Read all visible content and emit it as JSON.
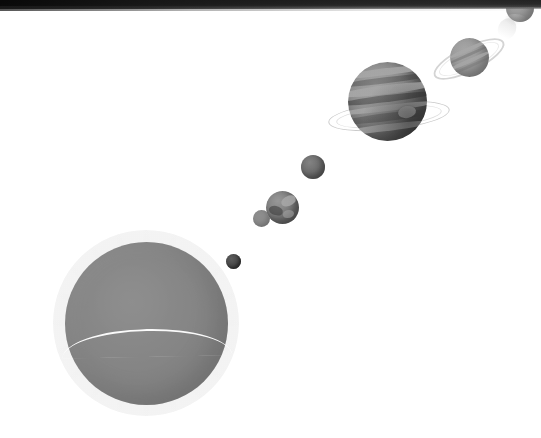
{
  "image": {
    "title": "Solar System diagram",
    "description": "Grayscale halftone print scan showing the Sun at lower left with the planets receding in a diagonal line toward the upper right",
    "background_color": "#ffffff",
    "width": 541,
    "height": 438,
    "style": "halftone grayscale scan",
    "scan_edge": {
      "name": "dark page edge band",
      "color": "#1a1a1a",
      "position": "top"
    }
  },
  "bodies": [
    {
      "id": "sun",
      "label": "Sun",
      "type": "star",
      "color": "#efefef",
      "has_corona": true,
      "has_seam_line": true,
      "diameter_px": 163,
      "center": {
        "x": 146,
        "y": 323
      }
    },
    {
      "id": "mercury",
      "label": "Mercury",
      "type": "planet",
      "order": 1,
      "color": "#6b6b6b",
      "diameter_px": 15,
      "center": {
        "x": 233,
        "y": 261
      }
    },
    {
      "id": "venus",
      "label": "Venus",
      "type": "planet",
      "order": 2,
      "color": "#f2f2f2",
      "diameter_px": 17,
      "center": {
        "x": 261,
        "y": 218
      }
    },
    {
      "id": "earth",
      "label": "Earth",
      "type": "planet",
      "order": 3,
      "color": "#b4b4b4",
      "diameter_px": 33,
      "center": {
        "x": 282,
        "y": 207
      }
    },
    {
      "id": "mars",
      "label": "Mars",
      "type": "planet",
      "order": 4,
      "color": "#9c9c9c",
      "diameter_px": 24,
      "center": {
        "x": 313,
        "y": 167
      }
    },
    {
      "id": "jupiter",
      "label": "Jupiter",
      "type": "planet",
      "order": 5,
      "color": "#c2c2c2",
      "diameter_px": 79,
      "center": {
        "x": 387,
        "y": 101
      },
      "has_rings": true,
      "has_great_red_spot": true,
      "cloud_bands": 7
    },
    {
      "id": "saturn",
      "label": "Saturn",
      "type": "planet",
      "order": 6,
      "color": "#e0e0e0",
      "diameter_px": 39,
      "center": {
        "x": 469,
        "y": 57
      },
      "has_rings": true,
      "ring_tilt_deg": -26
    },
    {
      "id": "neptune",
      "label": "Neptune",
      "type": "planet",
      "order": 8,
      "color": "#dfdfdf",
      "diameter_px": 28,
      "center": {
        "x": 520,
        "y": 8
      },
      "cropped_at_edge": true
    }
  ]
}
